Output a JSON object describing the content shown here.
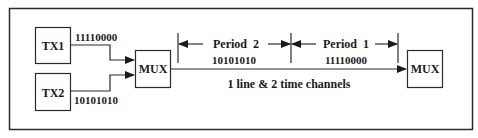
{
  "diagram": {
    "transmitters": [
      {
        "id": "tx1",
        "label": "TX1",
        "bits": "11110000"
      },
      {
        "id": "tx2",
        "label": "TX2",
        "bits": "10101010"
      }
    ],
    "mux_left": {
      "label": "MUX"
    },
    "mux_right": {
      "label": "MUX"
    },
    "periods": [
      {
        "label": "Period  2",
        "bits": "10101010"
      },
      {
        "label": "Period  1",
        "bits": "11110000"
      }
    ],
    "line_caption": "1 line & 2 time channels",
    "colors": {
      "stroke": "#2a2a2a",
      "text": "#1a1a1a",
      "background": "#ffffff"
    }
  }
}
